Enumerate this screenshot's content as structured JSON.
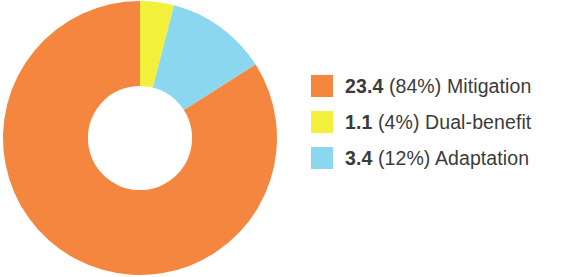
{
  "chart_data": {
    "type": "pie",
    "variant": "donut",
    "title": "",
    "subtitle": "",
    "xlabel": "",
    "ylabel": "",
    "unit": "",
    "total": 27.9,
    "start_angle_deg": 0,
    "direction": "clockwise",
    "inner_radius_ratio": 0.38,
    "grid": false,
    "legend_position": "right",
    "categories": [
      "Dual-benefit",
      "Adaptation",
      "Mitigation"
    ],
    "values": [
      1.1,
      3.4,
      23.4
    ],
    "percentages": [
      4,
      12,
      84
    ],
    "slices": [
      {
        "label": "Dual-benefit",
        "value": 1.1,
        "percent": 4,
        "color": "#F2F03A"
      },
      {
        "label": "Adaptation",
        "value": 3.4,
        "percent": 12,
        "color": "#8BD7EF"
      },
      {
        "label": "Mitigation",
        "value": 23.4,
        "percent": 84,
        "color": "#F5863F"
      }
    ]
  },
  "colors": {
    "mitigation": "#F5863F",
    "dual_benefit": "#F2F03A",
    "adaptation": "#8BD7EF",
    "text": "#3b3b3b",
    "background": "#ffffff",
    "hole": "#ffffff"
  },
  "legend": {
    "items": [
      {
        "swatch_name": "mitigation",
        "color": "#F5863F",
        "value": "23.4",
        "rest": " (84%) Mitigation",
        "percent": "84%",
        "label": "Mitigation"
      },
      {
        "swatch_name": "dual-benefit",
        "color": "#F2F03A",
        "value": "1.1",
        "rest": " (4%) Dual-benefit",
        "percent": "4%",
        "label": "Dual-benefit"
      },
      {
        "swatch_name": "adaptation",
        "color": "#8BD7EF",
        "value": "3.4",
        "rest": " (12%) Adaptation",
        "percent": "12%",
        "label": "Adaptation"
      }
    ]
  }
}
